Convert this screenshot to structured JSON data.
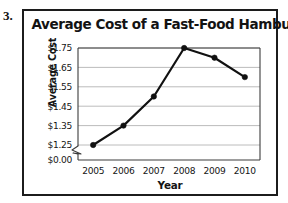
{
  "item_number": "3.",
  "chart_data": {
    "type": "line",
    "title": "Average Cost of a Fast-Food Hamburger",
    "xlabel": "Year",
    "ylabel": "Average Cost",
    "categories": [
      "2005",
      "2006",
      "2007",
      "2008",
      "2009",
      "2010"
    ],
    "values": [
      1.25,
      1.35,
      1.5,
      1.75,
      1.7,
      1.6
    ],
    "value_labels": [
      "$1.25",
      "$1.35",
      "$1.50",
      "$1.75",
      "$1.70",
      "$1.60"
    ],
    "ytick_labels": [
      "$1.75",
      "$1.65",
      "$1.55",
      "$1.45",
      "$1.35",
      "$1.25",
      "$0.00"
    ],
    "ytick_values": [
      1.75,
      1.65,
      1.55,
      1.45,
      1.35,
      1.25,
      0.0
    ],
    "ylim": [
      1.25,
      1.75
    ],
    "y_axis_break": true,
    "y_axis_break_label": "$0.00",
    "grid": "horizontal",
    "legend": "none",
    "line_color": "#111111",
    "marker": "circle",
    "marker_color": "#111111",
    "gridline_color": "#b4b4b4",
    "plot_border_color": "#3c3c3c",
    "frame_color": "#1c1c1c",
    "background_color": "#ffffff"
  }
}
